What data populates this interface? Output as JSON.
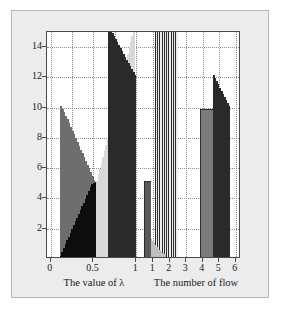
{
  "figure": {
    "panel_background": "#ececed",
    "panel_border": "#b9b7b3",
    "plot_background": "#ffffff",
    "axis_color": "#4a4a4a",
    "grid_color": "#8c8c8c"
  },
  "chart_data": {
    "type": "bar",
    "title": "",
    "subtitle": "",
    "grid": true,
    "legend": false,
    "ylabel": "",
    "ylim": [
      0,
      15
    ],
    "yticks": [
      2,
      4,
      6,
      8,
      10,
      12,
      14
    ],
    "ytick_labels": [
      "2",
      "4",
      "6",
      "8",
      "10",
      "12",
      "14"
    ],
    "xlim": [
      0,
      6.35
    ],
    "xlabel_primary": "The value of λ",
    "xlabel_secondary": "The number of flow",
    "xticks_lambda": [
      0,
      0.5,
      1
    ],
    "xtick_labels_lambda": [
      "0",
      "0.5",
      "1"
    ],
    "xticks_flow": [
      1,
      2,
      3,
      4,
      5,
      6
    ],
    "xtick_labels_flow": [
      "1",
      "2",
      "3",
      "4",
      "5",
      "6"
    ],
    "xticks_lambda_positions": [
      0.12,
      1.52,
      2.92
    ],
    "xticks_flow_positions": [
      3.48,
      4.02,
      4.56,
      5.1,
      5.64,
      6.18
    ],
    "gridline_x_positions": [
      0.12,
      0.82,
      1.52,
      2.22,
      2.92,
      3.48,
      4.02,
      4.56,
      5.1,
      5.64,
      6.18
    ],
    "palette": {
      "black": "#0d0d0d",
      "dark_gray": "#3a3a3a",
      "mid_gray": "#6e6e6e",
      "light_gray": "#c8c8c8",
      "very_light": "#f2f2f2",
      "white": "#ffffff",
      "edge": "#2b2b2b"
    },
    "series": [
      {
        "name": "descending-gray-staircase",
        "color": "#6e6e6e",
        "x_start": 0.42,
        "x_end": 1.62,
        "values": [
          10.0,
          9.8,
          9.6,
          9.35,
          9.1,
          8.85,
          8.6,
          8.35,
          8.1,
          7.85,
          7.6,
          7.35,
          7.1,
          6.85,
          6.6,
          6.35,
          6.1,
          5.85,
          5.6,
          5.35,
          5.1,
          4.9
        ]
      },
      {
        "name": "ascending-black-triangle",
        "color": "#0d0d0d",
        "x_start": 0.42,
        "x_end": 1.62,
        "values": [
          0.1,
          0.35,
          0.6,
          0.85,
          1.1,
          1.35,
          1.6,
          1.85,
          2.1,
          2.35,
          2.6,
          2.85,
          3.1,
          3.35,
          3.6,
          3.85,
          4.1,
          4.35,
          4.6,
          4.8,
          4.9,
          4.95
        ]
      },
      {
        "name": "ascending-light-staircase",
        "color": "#d8d8d8",
        "x_start": 1.62,
        "x_end": 2.86,
        "values": [
          5.0,
          5.4,
          5.8,
          6.2,
          6.6,
          7.0,
          7.4,
          7.8,
          8.2,
          8.6,
          9.0,
          9.4,
          9.8,
          10.2,
          10.6,
          11.0,
          11.4,
          11.8,
          12.2,
          12.6,
          13.0,
          13.4,
          13.8,
          14.2,
          14.6,
          15.0
        ]
      },
      {
        "name": "descending-dark-wedge",
        "color": "#2a2a2a",
        "x_start": 2.0,
        "x_end": 2.9,
        "values": [
          15.0,
          15.0,
          14.8,
          14.6,
          14.4,
          14.2,
          14.0,
          13.8,
          13.6,
          13.4,
          13.2,
          13.0,
          12.8,
          12.6,
          12.4,
          12.2,
          12.0
        ]
      },
      {
        "name": "compressed-light-bars",
        "color": "#ececec",
        "x_start": 3.52,
        "x_end": 4.28,
        "values": [
          15.0,
          15.0,
          15.0,
          15.0,
          15.0,
          15.0,
          15.0,
          15.0,
          15.0,
          15.0
        ]
      },
      {
        "name": "small-descending-steps",
        "color": "#bfbfbf",
        "x_start": 3.36,
        "x_end": 3.86,
        "values": [
          1.2,
          1.05,
          0.9,
          0.78,
          0.66,
          0.54,
          0.44,
          0.34,
          0.26,
          0.18
        ]
      },
      {
        "name": "right-block-gray",
        "color": "#7a7a7a",
        "x_start": 5.02,
        "x_end": 5.42,
        "values": [
          9.8
        ]
      },
      {
        "name": "right-block-dark-steps",
        "color": "#2a2a2a",
        "x_start": 5.42,
        "x_end": 5.98,
        "values": [
          12.0,
          11.8,
          11.6,
          11.4,
          11.2,
          11.0,
          10.8,
          10.6,
          10.4,
          10.2,
          10.0
        ]
      },
      {
        "name": "mid-gray-column",
        "color": "#5a5a5a",
        "x_start": 3.18,
        "x_end": 3.4,
        "values": [
          5.0
        ]
      }
    ]
  }
}
